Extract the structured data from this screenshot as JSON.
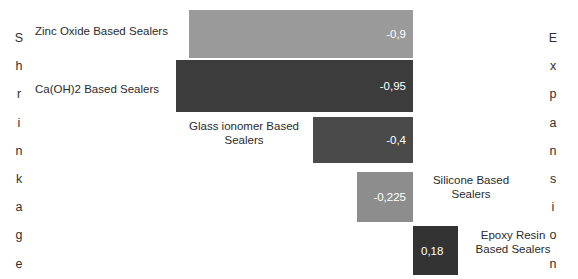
{
  "axis_captions": {
    "left": "Shrinkage",
    "right": "Expansion"
  },
  "chart_data": {
    "type": "bar",
    "orientation": "horizontal",
    "title": "",
    "xlabel": "",
    "ylabel": "",
    "grid": false,
    "legend": "none",
    "axis_captions": {
      "negative_side": "Shrinkage",
      "positive_side": "Expansion"
    },
    "xlim": [
      -1.0,
      0.4
    ],
    "categories": [
      "Zinc Oxide Based Sealers",
      "Ca(OH)2 Based Sealers",
      "Glass ionomer Based Sealers",
      "Silicone Based Sealers",
      "Epoxy Resin Based Sealers"
    ],
    "values": [
      -0.9,
      -0.95,
      -0.4,
      -0.225,
      0.18
    ],
    "value_labels": [
      "-0,9",
      "-0,95",
      "-0,4",
      "-0,225",
      "0,18"
    ],
    "colors": [
      "#9a9a9a",
      "#3c3c3c",
      "#4a4a4a",
      "#8d8d8d",
      "#333333"
    ]
  },
  "bars": [
    {
      "name": "zinc-oxide",
      "label": "Zinc Oxide Based Sealers",
      "label_lines": "Zinc Oxide Based Sealers",
      "value_label": "-0,9",
      "value": -0.9,
      "color": "#9a9a9a"
    },
    {
      "name": "ca-oh-2",
      "label": "Ca(OH)2 Based Sealers",
      "label_lines": "Ca(OH)2 Based Sealers",
      "value_label": "-0,95",
      "value": -0.95,
      "color": "#3c3c3c"
    },
    {
      "name": "glass-ionomer",
      "label": "Glass ionomer Based Sealers",
      "label_lines": "Glass ionomer Based\nSealers",
      "value_label": "-0,4",
      "value": -0.4,
      "color": "#4a4a4a"
    },
    {
      "name": "silicone",
      "label": "Silicone Based Sealers",
      "label_lines": "Silicone Based\nSealers",
      "value_label": "-0,225",
      "value": -0.225,
      "color": "#8d8d8d"
    },
    {
      "name": "epoxy-resin",
      "label": "Epoxy Resin Based Sealers",
      "label_lines": "Epoxy Resin\nBased Sealers",
      "value_label": "0,18",
      "value": 0.18,
      "color": "#333333"
    }
  ]
}
